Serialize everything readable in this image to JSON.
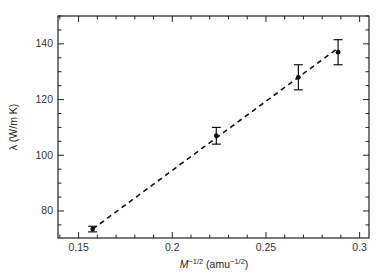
{
  "chart_data": {
    "type": "scatter",
    "title": "",
    "xlabel": "M^-1/2 (amu^-1/2)",
    "xlabel_parts": {
      "base": "M",
      "exp": "−1/2",
      "unit_open": " (amu",
      "unit_exp": "−1/2",
      "unit_close": ")"
    },
    "ylabel": "λ (W/m K)",
    "xlim": [
      0.139,
      0.305
    ],
    "ylim": [
      70.3,
      150
    ],
    "xticks": [
      0.15,
      0.2,
      0.25,
      0.3
    ],
    "xtick_labels": [
      "0.15",
      "0.2",
      "0.25",
      "0.3"
    ],
    "x_minor_step": 0.01,
    "yticks": [
      80,
      100,
      120,
      140
    ],
    "ytick_labels": [
      "80",
      "100",
      "120",
      "140"
    ],
    "y_minor_step": 5,
    "grid": false,
    "legend": null,
    "series": [
      {
        "name": "measured",
        "style": "points-with-errorbars",
        "color": "#111111",
        "x": [
          0.1575,
          0.2235,
          0.2673,
          0.2885
        ],
        "y": [
          73.5,
          107,
          128,
          137
        ],
        "yerr": [
          1,
          3,
          4.5,
          4.5
        ]
      },
      {
        "name": "linear-fit",
        "style": "dashed-line",
        "color": "#111111",
        "x": [
          0.1575,
          0.2885
        ],
        "y": [
          73.5,
          138.5
        ]
      }
    ]
  }
}
